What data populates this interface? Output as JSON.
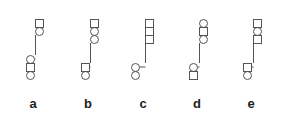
{
  "diagram": {
    "stroke_color": "#555555",
    "options": [
      {
        "label": "a",
        "top_stack": [
          "square",
          "circle"
        ],
        "bottom_stack": [
          "circle",
          "square",
          "circle"
        ]
      },
      {
        "label": "b",
        "top_stack": [
          "square",
          "circle",
          "circle"
        ],
        "bottom_stack": [
          "square",
          "circle"
        ]
      },
      {
        "label": "c",
        "top_stack": [
          "square",
          "square",
          "square"
        ],
        "bottom_stack": [
          "circle",
          "circle"
        ]
      },
      {
        "label": "d",
        "top_stack": [
          "circle",
          "square",
          "circle"
        ],
        "bottom_stack": [
          "circle",
          "square"
        ]
      },
      {
        "label": "e",
        "top_stack": [
          "square",
          "circle",
          "square"
        ],
        "bottom_stack": [
          "square",
          "circle"
        ]
      }
    ]
  }
}
